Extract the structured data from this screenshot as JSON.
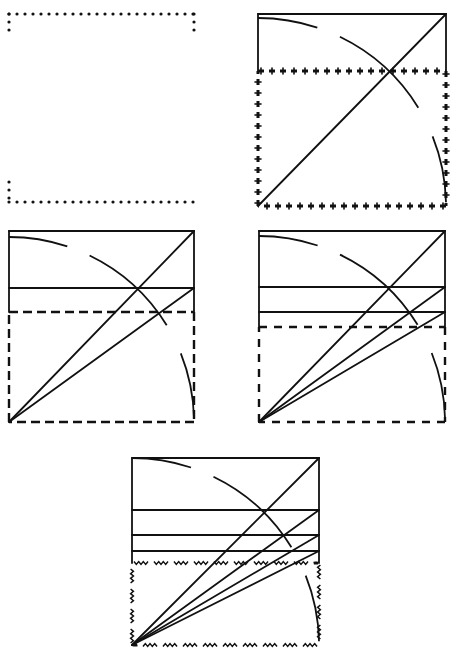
{
  "diagram": {
    "ink_color": "#111111",
    "background": "#ffffff",
    "panels": [
      {
        "id": "panel-1",
        "label": "square-dotted-outline",
        "style": "dotted",
        "box": {
          "x": 9,
          "y": 14,
          "w": 185,
          "h": 188
        }
      },
      {
        "id": "panel-2",
        "label": "square-with-diagonal-and-arc",
        "box": {
          "x": 258,
          "y": 14,
          "w": 188,
          "h": 192
        },
        "rect_style": "cross-dotted",
        "rect_top": 71,
        "horizontals": [],
        "diagonals_to_y": [
          14
        ]
      },
      {
        "id": "panel-3",
        "label": "root-2-rectangle",
        "box": {
          "x": 9,
          "y": 231,
          "w": 185,
          "h": 191
        },
        "rect_style": "dashed",
        "rect_top": 312,
        "horizontals": [
          288
        ],
        "diagonals_to_y": [
          231,
          288
        ]
      },
      {
        "id": "panel-4",
        "label": "root-3-rectangle",
        "box": {
          "x": 259,
          "y": 231,
          "w": 186,
          "h": 191
        },
        "rect_style": "hook-dashed",
        "rect_top": 327,
        "horizontals": [
          287,
          312
        ],
        "diagonals_to_y": [
          231,
          287,
          312
        ]
      },
      {
        "id": "panel-5",
        "label": "root-4-rectangle",
        "box": {
          "x": 132,
          "y": 458,
          "w": 187,
          "h": 187
        },
        "rect_style": "wavy",
        "rect_top": 563,
        "horizontals": [
          510,
          535,
          551
        ],
        "diagonals_to_y": [
          458,
          510,
          535,
          551
        ]
      }
    ]
  }
}
